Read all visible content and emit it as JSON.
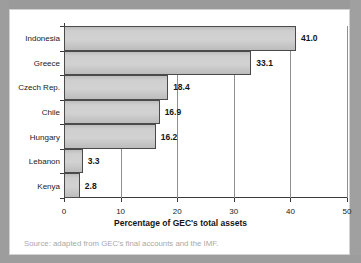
{
  "chart_data": {
    "type": "bar",
    "orientation": "horizontal",
    "title": "",
    "xlabel": "Percentage of GEC's total assets",
    "ylabel": "",
    "categories": [
      "Indonesia",
      "Greece",
      "Czech Rep.",
      "Chile",
      "Hungary",
      "Lebanon",
      "Kenya"
    ],
    "values": [
      41.0,
      33.1,
      18.4,
      16.9,
      16.2,
      3.3,
      2.8
    ],
    "value_labels": [
      "41.0",
      "33.1",
      "18.4",
      "16.9",
      "16.2",
      "3.3",
      "2.8"
    ],
    "xlim": [
      0,
      50
    ],
    "xticks": [
      0,
      10,
      20,
      30,
      40,
      50
    ],
    "xtick_labels": [
      "0",
      "10",
      "20",
      "30",
      "40",
      "50"
    ],
    "grid": "vertical",
    "legend": "none",
    "bar_fill_color": "#cfcfcf",
    "bar_border_color": "#4a4a4a",
    "axis_color": "#3a3a3a",
    "gridline_color": "#8f8f8f"
  },
  "footer": {
    "source_note": "Source: adapted from GEC's final accounts and the IMF."
  },
  "frame": {
    "surround_color": "#9d9d9d",
    "card_background": "#ffffff",
    "card_border_color": "#d2d2d2"
  }
}
